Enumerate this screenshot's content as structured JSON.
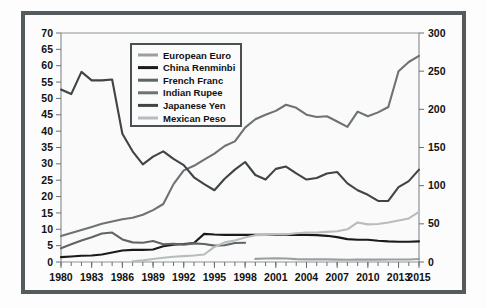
{
  "chart_data": {
    "type": "line",
    "title": "",
    "xlabel": "",
    "ylabel": "",
    "xlim": [
      1980,
      2015
    ],
    "ylim_left": [
      0,
      70
    ],
    "ylim_right": [
      0,
      300
    ],
    "grid": false,
    "legend_position": "top-left-inside",
    "x_tick_labels": [
      "1980",
      "1983",
      "1986",
      "1989",
      "1992",
      "1995",
      "1998",
      "2001",
      "2004",
      "2007",
      "2010",
      "2013",
      "2015"
    ],
    "x_tick_values": [
      1980,
      1983,
      1986,
      1989,
      1992,
      1995,
      1998,
      2001,
      2004,
      2007,
      2010,
      2013,
      2015
    ],
    "x_minor_ticks_every": 1,
    "y_left_tick_labels": [
      "0",
      "5",
      "10",
      "15",
      "20",
      "25",
      "30",
      "35",
      "40",
      "45",
      "50",
      "55",
      "60",
      "65",
      "70"
    ],
    "y_left_tick_values": [
      0,
      5,
      10,
      15,
      20,
      25,
      30,
      35,
      40,
      45,
      50,
      55,
      60,
      65,
      70
    ],
    "y_right_tick_labels": [
      "0",
      "50",
      "100",
      "150",
      "200",
      "250",
      "300"
    ],
    "y_right_tick_values": [
      0,
      50,
      100,
      150,
      200,
      250,
      300
    ],
    "x": [
      1980,
      1981,
      1982,
      1983,
      1984,
      1985,
      1986,
      1987,
      1988,
      1989,
      1990,
      1991,
      1992,
      1993,
      1994,
      1995,
      1996,
      1997,
      1998,
      1999,
      2000,
      2001,
      2002,
      2003,
      2004,
      2005,
      2006,
      2007,
      2008,
      2009,
      2010,
      2011,
      2012,
      2013,
      2014,
      2015
    ],
    "series": [
      {
        "name": "European Euro",
        "color": "#9a9fa1",
        "axis": "left",
        "x": [
          1999,
          2000,
          2001,
          2002,
          2003,
          2004,
          2005,
          2006,
          2007,
          2008,
          2009,
          2010,
          2011,
          2012,
          2013,
          2014,
          2015
        ],
        "values": [
          0.94,
          1.08,
          1.12,
          1.06,
          0.89,
          0.8,
          0.8,
          0.8,
          0.73,
          0.68,
          0.72,
          0.76,
          0.72,
          0.78,
          0.75,
          0.75,
          0.9
        ]
      },
      {
        "name": "China Renminbi",
        "color": "#1a1a1a",
        "axis": "left",
        "x": [
          1980,
          1981,
          1982,
          1983,
          1984,
          1985,
          1986,
          1987,
          1988,
          1989,
          1990,
          1991,
          1992,
          1993,
          1994,
          1995,
          1996,
          1997,
          1998,
          1999,
          2000,
          2001,
          2002,
          2003,
          2004,
          2005,
          2006,
          2007,
          2008,
          2009,
          2010,
          2011,
          2012,
          2013,
          2014,
          2015
        ],
        "values": [
          1.5,
          1.7,
          1.9,
          2.0,
          2.3,
          2.9,
          3.5,
          3.7,
          3.7,
          3.8,
          4.8,
          5.3,
          5.5,
          5.8,
          8.6,
          8.4,
          8.3,
          8.3,
          8.3,
          8.3,
          8.3,
          8.3,
          8.3,
          8.3,
          8.3,
          8.2,
          8.0,
          7.6,
          7.0,
          6.8,
          6.8,
          6.5,
          6.3,
          6.2,
          6.2,
          6.3
        ]
      },
      {
        "name": "French Franc",
        "color": "#5f6466",
        "axis": "left",
        "x": [
          1980,
          1981,
          1982,
          1983,
          1984,
          1985,
          1986,
          1987,
          1988,
          1989,
          1990,
          1991,
          1992,
          1993,
          1994,
          1995,
          1996,
          1997,
          1998
        ],
        "values": [
          4.2,
          5.4,
          6.6,
          7.6,
          8.7,
          9.0,
          6.9,
          6.0,
          5.9,
          6.4,
          5.4,
          5.6,
          5.3,
          5.7,
          5.5,
          5.0,
          5.1,
          5.8,
          5.9
        ]
      },
      {
        "name": "Indian Rupee",
        "color": "#6d7274",
        "axis": "right",
        "x": [
          1980,
          1981,
          1982,
          1983,
          1984,
          1985,
          1986,
          1987,
          1988,
          1989,
          1990,
          1991,
          1992,
          1993,
          1994,
          1995,
          1996,
          1997,
          1998,
          1999,
          2000,
          2001,
          2002,
          2003,
          2004,
          2005,
          2006,
          2007,
          2008,
          2009,
          2010,
          2011,
          2012,
          2013,
          2014,
          2015
        ],
        "values": [
          34,
          38,
          42,
          46,
          50,
          53,
          56,
          58,
          62,
          68,
          76,
          102,
          120,
          126,
          134,
          142,
          152,
          158,
          176,
          187,
          193,
          198,
          206,
          202,
          193,
          190,
          191,
          184,
          177,
          197,
          191,
          196,
          203,
          250,
          262,
          270
        ]
      },
      {
        "name": "Japanese Yen",
        "color": "#3f4446",
        "axis": "right",
        "x": [
          1980,
          1981,
          1982,
          1983,
          1984,
          1985,
          1986,
          1987,
          1988,
          1989,
          1990,
          1991,
          1992,
          1993,
          1994,
          1995,
          1996,
          1997,
          1998,
          1999,
          2000,
          2001,
          2002,
          2003,
          2004,
          2005,
          2006,
          2007,
          2008,
          2009,
          2010,
          2011,
          2012,
          2013,
          2014,
          2015
        ],
        "values": [
          226,
          220,
          249,
          238,
          238,
          239,
          168,
          145,
          128,
          138,
          145,
          135,
          127,
          111,
          102,
          94,
          109,
          121,
          131,
          114,
          108,
          122,
          125,
          116,
          108,
          110,
          116,
          118,
          103,
          94,
          88,
          80,
          80,
          98,
          106,
          121
        ]
      },
      {
        "name": "Mexican Peso",
        "color": "#b7bcbe",
        "axis": "left",
        "x": [
          1987,
          1988,
          1989,
          1990,
          1991,
          1992,
          1993,
          1994,
          1995,
          1996,
          1997,
          1998,
          1999,
          2000,
          2001,
          2002,
          2003,
          2004,
          2005,
          2006,
          2007,
          2008,
          2009,
          2010,
          2011,
          2012,
          2013,
          2014,
          2015
        ],
        "values": [
          0.2,
          0.5,
          0.9,
          1.3,
          1.6,
          1.8,
          2.0,
          2.3,
          4.6,
          6.0,
          6.6,
          7.5,
          8.2,
          8.3,
          8.4,
          8.4,
          8.8,
          9.0,
          9.0,
          9.2,
          9.4,
          10.0,
          12.1,
          11.5,
          11.6,
          12.1,
          12.7,
          13.3,
          15.3
        ]
      }
    ]
  }
}
